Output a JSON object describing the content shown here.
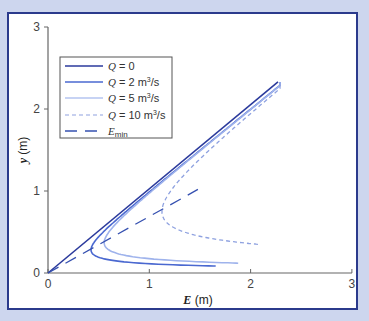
{
  "chart_data": {
    "type": "line",
    "title": "",
    "xlabel": "E (m)",
    "ylabel": "y (m)",
    "xlim": [
      0,
      3
    ],
    "ylim": [
      0,
      3
    ],
    "xticks": [
      "0",
      "1",
      "2",
      "3"
    ],
    "yticks": [
      "0",
      "1",
      "2",
      "3"
    ],
    "grid": false,
    "legend_position": "upper-left",
    "series": [
      {
        "name": "Q = 0",
        "style": "solid",
        "color": "#2b3a9c",
        "x": [
          0,
          2.27
        ],
        "y": [
          0,
          2.33
        ]
      },
      {
        "name": "Q = 2 m³/s",
        "style": "solid",
        "color": "#4a68d0",
        "yc": 0.24,
        "x_end": 2.27,
        "y_top": 2.33,
        "y_bottom": 0.085,
        "nose": [
          0.36,
          0.24
        ]
      },
      {
        "name": "Q = 5 m³/s",
        "style": "solid",
        "color": "#9fb3ec",
        "yc": 0.34,
        "x_end": 2.27,
        "y_top": 2.33,
        "y_bottom": 0.12,
        "nose": [
          0.51,
          0.34
        ]
      },
      {
        "name": "Q = 10 m³/s",
        "style": "dashed",
        "color": "#8fa2e0",
        "yc": 0.72,
        "x_end": 2.27,
        "y_top": 2.33,
        "y_bottom": 0.35,
        "nose": [
          1.05,
          0.72
        ]
      },
      {
        "name": "E_min",
        "style": "long-dash",
        "color": "#3550b0",
        "x": [
          0,
          1.48
        ],
        "y": [
          0,
          1.02
        ]
      }
    ]
  },
  "legend": {
    "items": [
      {
        "q": "Q",
        "rest": " = 0",
        "sup": ""
      },
      {
        "q": "Q",
        "rest": " = 2 m",
        "sup": "3",
        "tail": "/s"
      },
      {
        "q": "Q",
        "rest": " = 5 m",
        "sup": "3",
        "tail": "/s"
      },
      {
        "q": "Q",
        "rest": " = 10 m",
        "sup": "3",
        "tail": "/s"
      },
      {
        "q": "E",
        "rest": "",
        "sub": "min"
      }
    ]
  },
  "axes": {
    "x_title_var": "E",
    "x_title_unit": " (m)",
    "y_title_var": "y",
    "y_title_unit": " (m)",
    "x_ticks": [
      "0",
      "1",
      "2",
      "3"
    ],
    "y_ticks": [
      "0",
      "1",
      "2",
      "3"
    ]
  }
}
